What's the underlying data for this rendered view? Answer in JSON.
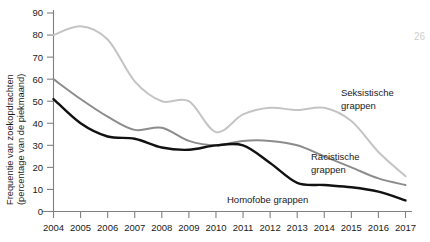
{
  "page": {
    "corner_number": "26"
  },
  "chart_data": {
    "type": "line",
    "title": "",
    "xlabel": "",
    "ylabel": "Frequentie van zoekopdrachten (percentage van de piekmaand)",
    "ylabel_line1": "Frequentie van zoekopdrachten",
    "ylabel_line2": "(percentage van de piekmaand)",
    "x": [
      2004,
      2005,
      2006,
      2007,
      2008,
      2009,
      2010,
      2011,
      2012,
      2013,
      2014,
      2015,
      2016,
      2017
    ],
    "categories": [
      "2004",
      "2005",
      "2006",
      "2007",
      "2008",
      "2009",
      "2010",
      "2011",
      "2012",
      "2013",
      "2014",
      "2015",
      "2016",
      "2017"
    ],
    "xlim": [
      2004,
      2017
    ],
    "ylim": [
      0,
      90
    ],
    "yticks": [
      0,
      10,
      20,
      30,
      40,
      50,
      60,
      70,
      80,
      90
    ],
    "yticklabels": [
      "0",
      "10",
      "20",
      "30",
      "40",
      "50",
      "60",
      "70",
      "80",
      "90"
    ],
    "grid": false,
    "legend_position": "inline-annotations",
    "series": [
      {
        "name": "Seksistische grappen",
        "label_line1": "Seksistische",
        "label_line2": "grappen",
        "color": "#c4c4c4",
        "width": 2.0,
        "values": [
          80,
          84,
          78,
          59,
          50,
          50,
          36,
          44,
          47,
          46,
          47,
          41,
          27,
          16
        ]
      },
      {
        "name": "Racistische grappen",
        "label_line1": "Racistische",
        "label_line2": "grappen",
        "color": "#8c8c8c",
        "width": 2.0,
        "values": [
          60,
          51,
          43,
          37,
          38,
          32,
          30,
          32,
          32,
          30,
          25,
          20,
          15,
          12
        ]
      },
      {
        "name": "Homofobe grappen",
        "label_line1": "Homofobe grappen",
        "label_line2": "",
        "color": "#111111",
        "width": 2.4,
        "values": [
          51,
          40,
          34,
          33,
          29,
          28,
          30,
          30,
          22,
          13,
          12,
          11,
          9,
          5
        ]
      }
    ]
  }
}
